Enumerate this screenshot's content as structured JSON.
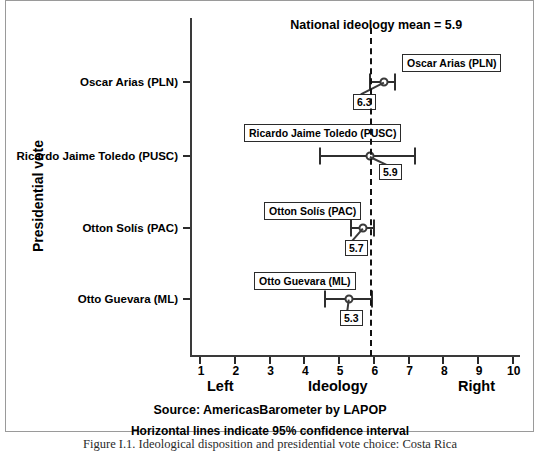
{
  "chart_data": {
    "type": "scatter",
    "title": "",
    "xlabel": "Ideology",
    "ylabel": "Presidential vote",
    "xlim": [
      0.5,
      10.5
    ],
    "grid": false,
    "legend": "none",
    "axis_left_label": "Left",
    "axis_center_label": "Ideology",
    "axis_right_label": "Right",
    "x_ticks": [
      "1",
      "2",
      "3",
      "4",
      "5",
      "6",
      "7",
      "8",
      "9",
      "10"
    ],
    "x_tick_values": [
      1,
      2,
      3,
      4,
      5,
      6,
      7,
      8,
      9,
      10
    ],
    "categories": [
      "Oscar Arias (PLN)",
      "Ricardo Jaime Toledo (PUSC)",
      "Otton Solís (PAC)",
      "Otto Guevara (ML)"
    ],
    "values": [
      6.3,
      5.9,
      5.7,
      5.3
    ],
    "value_labels": [
      "6.3",
      "5.9",
      "5.7",
      "5.3"
    ],
    "ci_low": [
      5.9,
      4.45,
      5.35,
      4.6
    ],
    "ci_high": [
      6.6,
      7.2,
      6.0,
      5.95
    ],
    "reference_line": {
      "value": 5.9,
      "label": "National ideology mean = 5.9",
      "style": "dashed"
    },
    "points": [
      {
        "category": "Oscar Arias (PLN)",
        "value": 6.3,
        "value_label": "6.3",
        "ci_low": 5.9,
        "ci_high": 6.6,
        "y": 82
      },
      {
        "category": "Ricardo Jaime Toledo (PUSC)",
        "value": 5.9,
        "value_label": "5.9",
        "ci_low": 4.45,
        "ci_high": 7.2,
        "y": 156
      },
      {
        "category": "Otton Solís (PAC)",
        "value": 5.7,
        "value_label": "5.7",
        "ci_low": 5.35,
        "ci_high": 6.0,
        "y": 228
      },
      {
        "category": "Otto Guevara (ML)",
        "value": 5.3,
        "value_label": "5.3",
        "ci_low": 4.6,
        "ci_high": 5.95,
        "y": 299
      }
    ]
  },
  "notes": {
    "source": "Source: AmericasBarometer by LAPOP",
    "confidence": "Horizontal lines indicate 95% confidence interval",
    "caption": "Figure I.1. Ideological disposition and presidential vote choice: Costa Rica"
  },
  "colors": {
    "axis": "#3a3a3a",
    "marker": "#3a3a3a",
    "reference_line": "#111111",
    "border": "#9a9a9a",
    "text": "#000000"
  }
}
